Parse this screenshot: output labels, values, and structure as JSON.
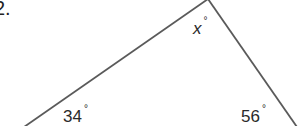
{
  "problem": {
    "number": "2."
  },
  "figure": {
    "type": "triangle",
    "line_color": "#5a5a5a",
    "vertices": {
      "apex": [
        208,
        0
      ],
      "bottom_left": [
        24,
        127
      ],
      "bottom_right": [
        297,
        127
      ]
    },
    "angles": [
      {
        "name": "apex",
        "value": "x",
        "unit": "°"
      },
      {
        "name": "bottom-left",
        "value": "34",
        "unit": "°"
      },
      {
        "name": "bottom-right",
        "value": "56",
        "unit": "°"
      }
    ]
  }
}
